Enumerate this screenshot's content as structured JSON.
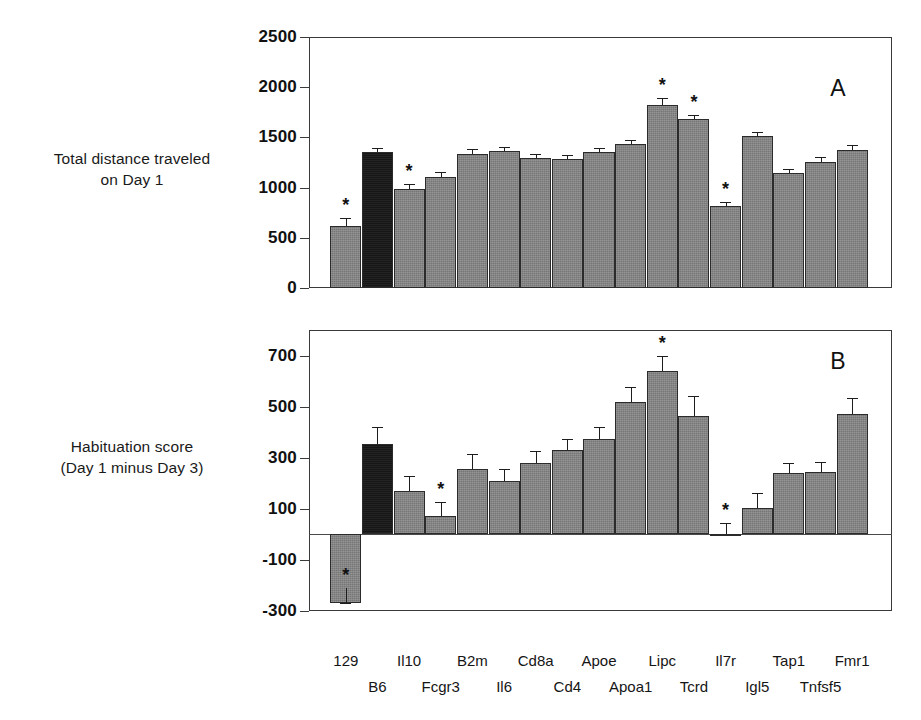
{
  "figure": {
    "panel_a_letter": "A",
    "panel_b_letter": "B",
    "axis_caption_a_line1": "Total distance traveled",
    "axis_caption_a_line2": "on Day 1",
    "axis_caption_b_line1": "Habituation score",
    "axis_caption_b_line2": "(Day 1 minus Day 3)",
    "bar_color": "#767676",
    "highlight_bar_color": "#161616",
    "axis_color": "#3a3a3a",
    "significance_marker": "*"
  },
  "chart_data": [
    {
      "type": "bar",
      "id": "panel-a",
      "title": "A",
      "xlabel": "",
      "ylabel": "Total distance traveled on Day 1",
      "ylim": [
        0,
        2500
      ],
      "yticks": [
        0,
        500,
        1000,
        1500,
        2000,
        2500
      ],
      "ytick_labels": [
        "0",
        "500",
        "1000",
        "1500",
        "2000",
        "2500"
      ],
      "grid": false,
      "legend": "none",
      "categories": [
        "129",
        "B6",
        "Il10",
        "Fcgr3",
        "B2m",
        "Il6",
        "Cd8a",
        "Cd4",
        "Apoe",
        "Apoa1",
        "Lipc",
        "Tcrd",
        "Il7r",
        "Igl5",
        "Tap1",
        "Tnfsf5",
        "Fmr1"
      ],
      "values": [
        620,
        1350,
        990,
        1110,
        1330,
        1360,
        1295,
        1280,
        1350,
        1430,
        1820,
        1680,
        820,
        1510,
        1145,
        1255,
        1375
      ],
      "errors": [
        75,
        45,
        50,
        45,
        55,
        45,
        40,
        40,
        45,
        45,
        75,
        40,
        40,
        45,
        45,
        45,
        45
      ],
      "highlighted": [
        "B6"
      ],
      "significant": [
        "129",
        "Il10",
        "Lipc",
        "Tcrd",
        "Il7r"
      ]
    },
    {
      "type": "bar",
      "id": "panel-b",
      "title": "B",
      "xlabel": "",
      "ylabel": "Habituation score (Day 1 minus Day 3)",
      "ylim": [
        -300,
        800
      ],
      "yticks": [
        -300,
        -100,
        100,
        300,
        500,
        700
      ],
      "ytick_labels": [
        "-300",
        "-100",
        "100",
        "300",
        "500",
        "700"
      ],
      "grid": false,
      "legend": "none",
      "categories": [
        "129",
        "B6",
        "Il10",
        "Fcgr3",
        "B2m",
        "Il6",
        "Cd8a",
        "Cd4",
        "Apoe",
        "Apoa1",
        "Lipc",
        "Tcrd",
        "Il7r",
        "Igl5",
        "Tap1",
        "Tnfsf5",
        "Fmr1"
      ],
      "values": [
        -270,
        355,
        170,
        70,
        255,
        210,
        280,
        330,
        375,
        520,
        640,
        465,
        0,
        105,
        240,
        245,
        470
      ],
      "errors": [
        60,
        65,
        60,
        55,
        60,
        45,
        45,
        45,
        45,
        55,
        60,
        75,
        45,
        55,
        40,
        40,
        65
      ],
      "highlighted": [
        "B6"
      ],
      "significant": [
        "129",
        "Fcgr3",
        "Lipc",
        "Il7r"
      ]
    }
  ],
  "x_axis": {
    "row1": [
      {
        "index": 0,
        "label": "129"
      },
      {
        "index": 2,
        "label": "Il10"
      },
      {
        "index": 4,
        "label": "B2m"
      },
      {
        "index": 6,
        "label": "Cd8a"
      },
      {
        "index": 8,
        "label": "Apoe"
      },
      {
        "index": 10,
        "label": "Lipc"
      },
      {
        "index": 12,
        "label": "Il7r"
      },
      {
        "index": 14,
        "label": "Tap1"
      },
      {
        "index": 16,
        "label": "Fmr1"
      }
    ],
    "row2": [
      {
        "index": 1,
        "label": "B6"
      },
      {
        "index": 3,
        "label": "Fcgr3"
      },
      {
        "index": 5,
        "label": "Il6"
      },
      {
        "index": 7,
        "label": "Cd4"
      },
      {
        "index": 9,
        "label": "Apoa1"
      },
      {
        "index": 11,
        "label": "Tcrd"
      },
      {
        "index": 13,
        "label": "Igl5"
      },
      {
        "index": 15,
        "label": "Tnfsf5"
      }
    ]
  }
}
